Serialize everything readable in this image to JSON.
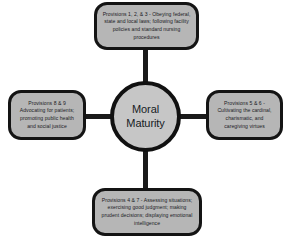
{
  "diagram": {
    "type": "hub-and-spoke",
    "center": {
      "label": "Moral Maturity"
    },
    "nodes": [
      {
        "position": "top",
        "label": "Provisions 1, 2, & 3 - Obeying federal, state and local laws; following facility policies and standard nursing procedures"
      },
      {
        "position": "right",
        "label": "Provisions 5 & 6 - Cultivating the cardinal, charismatic, and caregiving virtues"
      },
      {
        "position": "bottom",
        "label": "Provisions 4 & 7 - Assessing situations; exercising good judgment; making prudent decisions; displaying emotional intelligence"
      },
      {
        "position": "left",
        "label": "Provisions 8 & 9 Advocating for patients; promoting public health and social justice"
      }
    ],
    "colors": {
      "box_fill": "#b6b6b6",
      "hub_fill": "#c6c6c6",
      "outline": "#141414",
      "background": "#ffffff",
      "text": "#20201f"
    }
  }
}
